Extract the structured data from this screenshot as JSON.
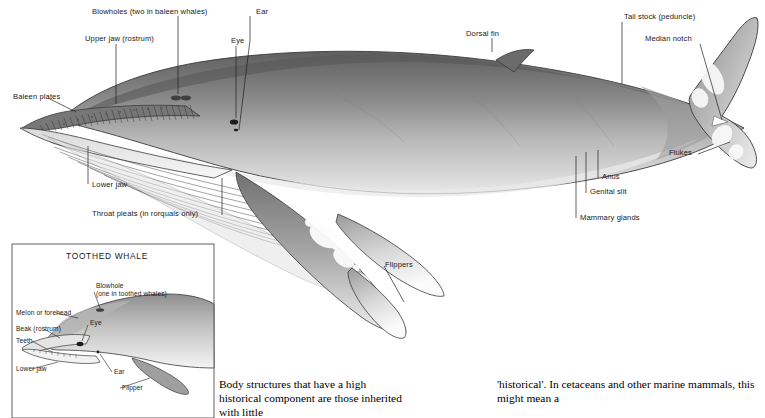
{
  "figure": {
    "main_title": "Baleen whale external anatomy (rorqual)",
    "inset_title": "TOOTHED WHALE",
    "main_labels": [
      {
        "id": "blowholes",
        "text": "Blowholes (two in baleen whales)"
      },
      {
        "id": "ear",
        "text": "Ear"
      },
      {
        "id": "dorsal-fin",
        "text": "Dorsal fin"
      },
      {
        "id": "tail-stock",
        "text": "Tail stock (peduncle)"
      },
      {
        "id": "median-notch",
        "text": "Median notch"
      },
      {
        "id": "upper-jaw",
        "text": "Upper jaw (rostrum)"
      },
      {
        "id": "eye",
        "text": "Eye"
      },
      {
        "id": "baleen-plates",
        "text": "Baleen plates"
      },
      {
        "id": "flukes",
        "text": "Flukes"
      },
      {
        "id": "lower-jaw",
        "text": "Lower jaw"
      },
      {
        "id": "throat-pleats",
        "text": "Throat pleats (in rorquals only)"
      },
      {
        "id": "anus",
        "text": "Anus"
      },
      {
        "id": "genital-slit",
        "text": "Genital slit"
      },
      {
        "id": "mammary-glands",
        "text": "Mammary glands"
      },
      {
        "id": "flippers",
        "text": "Flippers"
      }
    ],
    "inset_labels": [
      {
        "id": "blowhole",
        "text": "Blowhole"
      },
      {
        "id": "blowhole-sub",
        "text": "(one in toothed whales)"
      },
      {
        "id": "melon",
        "text": "Melon or forehead"
      },
      {
        "id": "inset-eye",
        "text": "Eye"
      },
      {
        "id": "beak",
        "text": "Beak (rostrum)"
      },
      {
        "id": "teeth",
        "text": "Teeth"
      },
      {
        "id": "inset-lower-jaw",
        "text": "Lower jaw"
      },
      {
        "id": "inset-ear",
        "text": "Ear"
      },
      {
        "id": "flipper",
        "text": "Flipper"
      }
    ]
  },
  "body_text": {
    "left_column": "Body structures that have a high historical component are those inherited with little",
    "right_column": "'historical'. In cetaceans and other marine mammals, this might mean a"
  },
  "colors": {
    "whale_dark": "#6f6f6f",
    "whale_mid": "#8d8d8d",
    "whale_light": "#cfcfcf",
    "whale_belly": "#f2f2f2",
    "line": "#2a2a2a",
    "text": "#1a1a1a"
  }
}
